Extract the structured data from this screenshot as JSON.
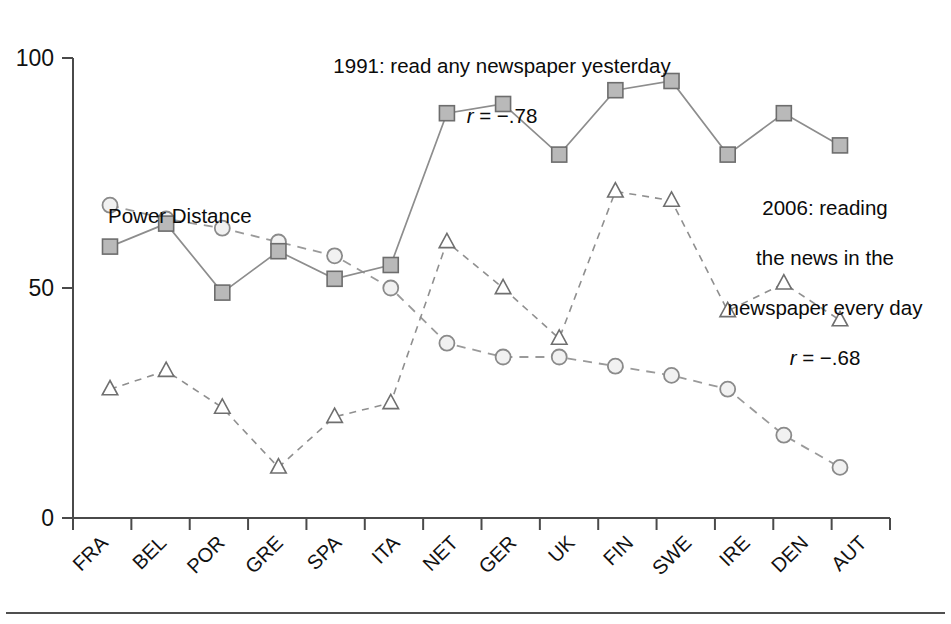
{
  "chart_data": {
    "type": "line",
    "title": "",
    "xlabel": "",
    "ylabel": "",
    "ylim": [
      0,
      100
    ],
    "yticks": [
      0,
      50,
      100
    ],
    "grid": false,
    "legend_position": "inline-annotations",
    "categories": [
      "FRA",
      "BEL",
      "POR",
      "GRE",
      "SPA",
      "ITA",
      "NET",
      "GER",
      "UK",
      "FIN",
      "SWE",
      "IRE",
      "DEN",
      "AUT"
    ],
    "series": [
      {
        "name": "Power Distance",
        "marker": "circle",
        "linestyle": "dashed",
        "values": [
          68,
          65,
          63,
          60,
          57,
          50,
          38,
          35,
          35,
          33,
          31,
          28,
          18,
          11
        ]
      },
      {
        "name": "1991: read any newspaper yesterday",
        "marker": "square",
        "linestyle": "solid",
        "correlation": "r = -.78",
        "values": [
          59,
          64,
          49,
          58,
          52,
          55,
          88,
          90,
          79,
          93,
          95,
          79,
          88,
          81
        ]
      },
      {
        "name": "2006: reading the news in the newspaper every day",
        "marker": "triangle",
        "linestyle": "dashed",
        "correlation": "r = -.68",
        "values": [
          28,
          32,
          24,
          11,
          22,
          25,
          60,
          50,
          39,
          71,
          69,
          45,
          51,
          43
        ]
      }
    ]
  },
  "annotations": {
    "series_1991": {
      "label": "1991: read any newspaper yesterday",
      "correlation_prefix": "r",
      "correlation_value": " = −.78"
    },
    "series_2006": {
      "line1": "2006: reading",
      "line2": "the news in the",
      "line3": "newspaper every day",
      "correlation_prefix": "r",
      "correlation_value": " = −.68"
    },
    "power_distance": {
      "label": "Power Distance"
    }
  },
  "axis": {
    "y_tick_labels": [
      "100",
      "50",
      "0"
    ],
    "x_tick_labels": [
      "FRA",
      "BEL",
      "POR",
      "GRE",
      "SPA",
      "ITA",
      "NET",
      "GER",
      "UK",
      "FIN",
      "SWE",
      "IRE",
      "DEN",
      "AUT"
    ]
  },
  "colors": {
    "square_fill": "#b9b9b9",
    "square_stroke": "#6d6d6d",
    "circle_fill": "#f1f1f1",
    "circle_stroke": "#8a8a8a",
    "triangle_fill": "#ffffff",
    "triangle_stroke": "#6f6f6f",
    "axis": "#4a4a4a",
    "text": "#0b0b0b"
  }
}
